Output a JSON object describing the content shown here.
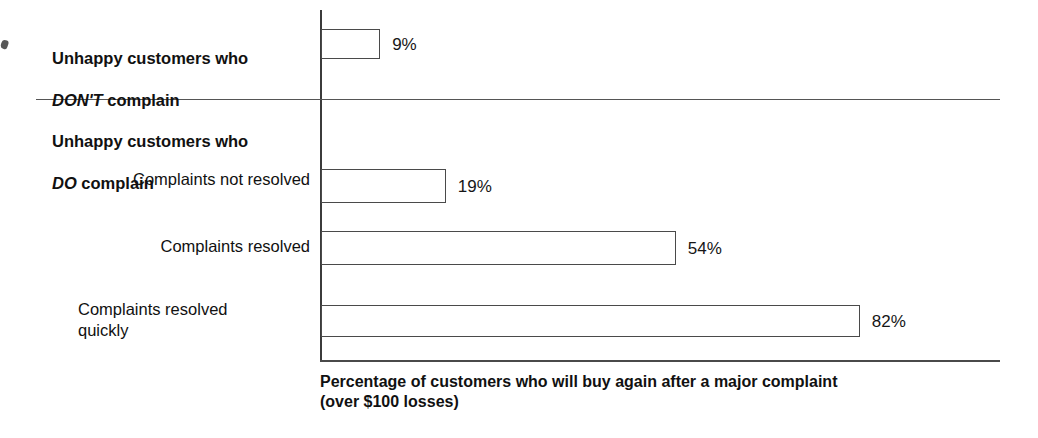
{
  "chart_data": {
    "type": "bar",
    "orientation": "horizontal",
    "title": "",
    "xlabel": "Percentage of customers who will buy again after a major complaint (over $100 losses)",
    "ylabel": "",
    "xlim": [
      0,
      100
    ],
    "grid": false,
    "legend": null,
    "categories": [
      "Unhappy customers who DON'T complain",
      "Complaints not resolved",
      "Complaints resolved",
      "Complaints resolved quickly"
    ],
    "values": [
      9,
      19,
      54,
      82
    ],
    "value_labels": [
      "9%",
      "19%",
      "54%",
      "82%"
    ],
    "groups": [
      {
        "heading_line1": "Unhappy customers who",
        "heading_emphasis": "DON'T",
        "heading_tail": " complain",
        "members": [
          "Unhappy customers who DON'T complain"
        ]
      },
      {
        "heading_line1": "Unhappy customers who",
        "heading_emphasis": "DO",
        "heading_tail": " complain",
        "members": [
          "Complaints not resolved",
          "Complaints resolved",
          "Complaints resolved quickly"
        ]
      }
    ],
    "annotations": []
  },
  "labels": {
    "group1_line1": "Unhappy customers who",
    "group1_emphasis": "DON'T",
    "group1_tail": " complain",
    "group2_line1": "Unhappy customers who",
    "group2_emphasis": "DO",
    "group2_tail": " complain",
    "sub_not_resolved": "Complaints not resolved",
    "sub_resolved": "Complaints resolved",
    "sub_resolved_quickly": "Complaints resolved\nquickly"
  },
  "values": {
    "dont_complain": "9%",
    "not_resolved": "19%",
    "resolved": "54%",
    "resolved_quickly": "82%"
  },
  "caption": {
    "line1": "Percentage of customers who will buy again after a major complaint",
    "line2": "(over $100 losses)"
  },
  "colors": {
    "background": "#ffffff",
    "axis": "#4a4a4a",
    "bar_outline": "#4a4a4a",
    "bar_fill": "#ffffff",
    "text": "#111111",
    "divider": "#555555"
  }
}
